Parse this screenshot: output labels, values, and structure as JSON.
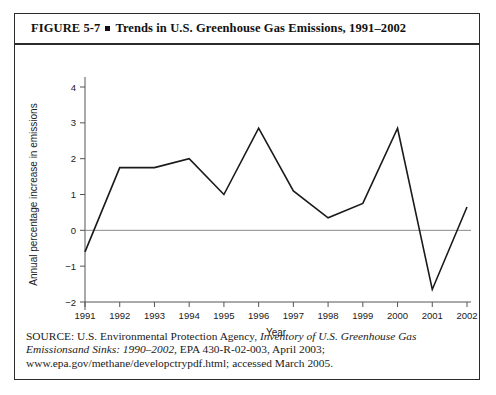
{
  "figure": {
    "number_label": "FIGURE  5-7",
    "bullet": "square-bullet",
    "title": "Trends in U.S. Greenhouse Gas Emissions, 1991–2002"
  },
  "source": {
    "line_1_plain": "SOURCE: U.S. Environmental Protection Agency, ",
    "line_1_italic": "Inventory of U.S. Greenhouse Gas Emissions",
    "line_2_italic": "and Sinks:  1990–2002,",
    "line_2_plain": " EPA 430-R-02-003, April 2003; www.epa.gov/methane/developctrypdf",
    "line_3_plain": ".html; accessed March 2005."
  },
  "chart_data": {
    "type": "line",
    "title": "Trends in U.S. Greenhouse Gas Emissions, 1991–2002",
    "xlabel": "Year",
    "ylabel": "Annual percentage increase in emissions",
    "categories": [
      "1991",
      "1992",
      "1993",
      "1994",
      "1995",
      "1996",
      "1997",
      "1998",
      "1999",
      "2000",
      "2001",
      "2002"
    ],
    "values": [
      -0.6,
      1.75,
      1.75,
      2.0,
      1.0,
      2.85,
      1.1,
      0.35,
      0.75,
      2.85,
      -1.65,
      0.65
    ],
    "series": [
      {
        "name": "Annual percentage increase in emissions",
        "values": [
          -0.6,
          1.75,
          1.75,
          2.0,
          1.0,
          2.85,
          1.1,
          0.35,
          0.75,
          2.85,
          -1.65,
          0.65
        ]
      }
    ],
    "ylim": [
      -2,
      4
    ],
    "yticks": [
      -2,
      -1,
      0,
      1,
      2,
      3,
      4
    ],
    "ytick_labels": [
      "−2",
      "−1",
      "0",
      "1",
      "2",
      "3",
      "4"
    ],
    "xticks": [
      "1991",
      "1992",
      "1993",
      "1994",
      "1995",
      "1996",
      "1997",
      "1998",
      "1999",
      "2000",
      "2001",
      "2002"
    ],
    "grid": false,
    "legend": "none",
    "zero_line": true,
    "line_color": "#1a1a1a",
    "axis_color": "#555555"
  }
}
